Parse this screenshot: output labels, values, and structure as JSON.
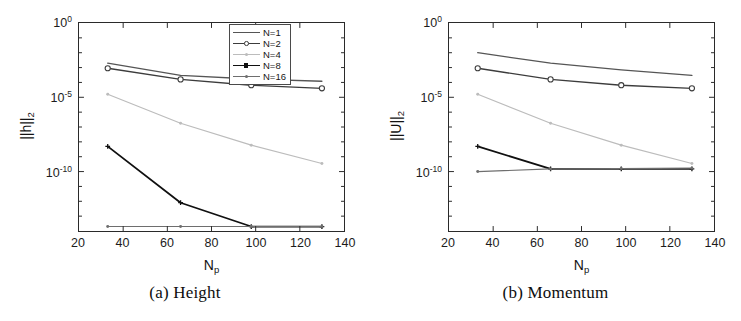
{
  "figure": {
    "panels": [
      {
        "id": "height",
        "caption": "(a) Height",
        "ylabel_main": "||h||",
        "ylabel_sub": "2",
        "xlabel_main": "N",
        "xlabel_sub": "p"
      },
      {
        "id": "momentum",
        "caption": "(b) Momentum",
        "ylabel_main": "||U||",
        "ylabel_sub": "2",
        "xlabel_main": "N",
        "xlabel_sub": "p"
      }
    ],
    "xticks": [
      "20",
      "40",
      "60",
      "80",
      "100",
      "120",
      "140"
    ],
    "yticks": [
      {
        "mantissa": "10",
        "exponent": "0"
      },
      {
        "mantissa": "10",
        "exponent": "-5"
      },
      {
        "mantissa": "10",
        "exponent": "-10"
      }
    ],
    "legend": {
      "entries": [
        {
          "label": "N=1",
          "color": "#555555",
          "marker": "none",
          "width": 1.3
        },
        {
          "label": "N=2",
          "color": "#3c3c3c",
          "marker": "circle",
          "width": 1.4
        },
        {
          "label": "N=4",
          "color": "#bcbcbc",
          "marker": "dot",
          "width": 1.2
        },
        {
          "label": "N=8",
          "color": "#101010",
          "marker": "plus",
          "width": 1.8
        },
        {
          "label": "N=16",
          "color": "#6e6e6e",
          "marker": "dot",
          "width": 1.2
        }
      ]
    },
    "colors": {
      "axis": "#2a2a2a",
      "text": "#141414",
      "background": "#ffffff"
    }
  },
  "chart_data": [
    {
      "type": "line",
      "id": "height",
      "title": "(a) Height",
      "xlabel": "N_p",
      "ylabel": "||h||_2",
      "xlim": [
        20,
        140
      ],
      "ylim": [
        1e-14,
        1
      ],
      "yscale": "log",
      "xticks": [
        20,
        40,
        60,
        80,
        100,
        120,
        140
      ],
      "yticks": [
        1,
        1e-05,
        1e-10
      ],
      "grid": false,
      "legend_position": "upper right",
      "x": [
        33,
        66,
        98,
        130
      ],
      "series": [
        {
          "name": "N=1",
          "values": [
            0.002,
            0.0003,
            0.00017,
            0.00012
          ]
        },
        {
          "name": "N=2",
          "values": [
            0.0009,
            0.00016,
            6.5e-05,
            4e-05
          ]
        },
        {
          "name": "N=4",
          "values": [
            1.6e-05,
            1.8e-07,
            6e-09,
            3.5e-10
          ]
        },
        {
          "name": "N=8",
          "values": [
            5e-09,
            8e-13,
            2e-14,
            2e-14
          ]
        },
        {
          "name": "N=16",
          "values": [
            2e-14,
            2e-14,
            2e-14,
            2e-14
          ]
        }
      ]
    },
    {
      "type": "line",
      "id": "momentum",
      "title": "(b) Momentum",
      "xlabel": "N_p",
      "ylabel": "||U||_2",
      "xlim": [
        20,
        140
      ],
      "ylim": [
        1e-14,
        1
      ],
      "yscale": "log",
      "xticks": [
        20,
        40,
        60,
        80,
        100,
        120,
        140
      ],
      "yticks": [
        1,
        1e-05,
        1e-10
      ],
      "grid": false,
      "legend_position": "upper right",
      "x": [
        33,
        66,
        98,
        130
      ],
      "series": [
        {
          "name": "N=1",
          "values": [
            0.01,
            0.002,
            0.0007,
            0.0003
          ]
        },
        {
          "name": "N=2",
          "values": [
            0.0009,
            0.00016,
            6.5e-05,
            4e-05
          ]
        },
        {
          "name": "N=4",
          "values": [
            1.6e-05,
            1.8e-07,
            6e-09,
            3.5e-10
          ]
        },
        {
          "name": "N=8",
          "values": [
            5e-09,
            1.5e-10,
            1.5e-10,
            1.5e-10
          ]
        },
        {
          "name": "N=16",
          "values": [
            1e-10,
            1.5e-10,
            1.6e-10,
            1.7e-10
          ]
        }
      ]
    }
  ]
}
